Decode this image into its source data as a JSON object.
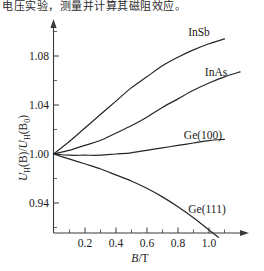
{
  "page": {
    "top_text_line": "电压实验，测量并计算其磁阻效应。"
  },
  "chart_data": {
    "type": "line",
    "title": "",
    "xlabel": "B/T",
    "ylabel": "U_H(B)/U_H(B_0)",
    "ylabel_parts": {
      "u1": "U",
      "sub1": "H",
      "mid": "(B)/",
      "u2": "U",
      "sub2": "H",
      "open": "(B",
      "sub3": "0",
      "close": ")"
    },
    "xlabel_parts": {
      "var": "B",
      "unit": "/T"
    },
    "xticks": [
      0.2,
      0.4,
      0.6,
      0.8,
      1.0
    ],
    "xtick_labels": [
      "0.2",
      "0.4",
      "0.6",
      "0.8",
      "1.0"
    ],
    "yticks": [
      0.94,
      1.0,
      1.04,
      1.08
    ],
    "ytick_labels": [
      "0.94",
      "1.00",
      "1.04",
      "1.08"
    ],
    "xlim": [
      0,
      1.22
    ],
    "ylim": [
      0.92,
      1.1
    ],
    "grid": false,
    "legend": "inline-curve-labels",
    "minor_ticks": true,
    "axis_arrows": true,
    "series": [
      {
        "name": "InSb",
        "label": "InSb",
        "color": "#262626",
        "x": [
          0.0,
          0.1,
          0.2,
          0.3,
          0.4,
          0.5,
          0.6,
          0.7,
          0.8,
          0.9,
          1.0,
          1.1
        ],
        "y": [
          1.0,
          1.01,
          1.021,
          1.032,
          1.043,
          1.054,
          1.063,
          1.072,
          1.079,
          1.085,
          1.09,
          1.094
        ]
      },
      {
        "name": "InAs",
        "label": "InAs",
        "color": "#262626",
        "x": [
          0.0,
          0.1,
          0.2,
          0.3,
          0.4,
          0.5,
          0.6,
          0.7,
          0.8,
          0.9,
          1.0,
          1.1,
          1.2
        ],
        "y": [
          1.0,
          1.003,
          1.007,
          1.011,
          1.017,
          1.023,
          1.03,
          1.038,
          1.045,
          1.052,
          1.058,
          1.063,
          1.067
        ]
      },
      {
        "name": "Ge(100)",
        "label": "Ge(100)",
        "color": "#262626",
        "x": [
          0.0,
          0.1,
          0.2,
          0.3,
          0.4,
          0.5,
          0.6,
          0.7,
          0.8,
          0.9,
          1.0,
          1.1
        ],
        "y": [
          1.0,
          0.999,
          0.999,
          0.999,
          1.0,
          1.001,
          1.003,
          1.005,
          1.007,
          1.009,
          1.011,
          1.012
        ]
      },
      {
        "name": "Ge(111)",
        "label": "Ge(111)",
        "color": "#262626",
        "x": [
          0.0,
          0.1,
          0.2,
          0.3,
          0.4,
          0.5,
          0.6,
          0.7,
          0.8,
          0.9,
          1.0,
          1.06
        ],
        "y": [
          1.0,
          0.996,
          0.992,
          0.988,
          0.983,
          0.978,
          0.972,
          0.965,
          0.957,
          0.948,
          0.938,
          0.932
        ]
      }
    ],
    "annotations": [
      {
        "text": "InSb",
        "x": 1.0,
        "y": 1.098
      },
      {
        "text": "InAs",
        "x": 1.08,
        "y": 1.072
      },
      {
        "text": "Ge(100)",
        "x": 0.98,
        "y": 1.02
      },
      {
        "text": "Ge(111)",
        "x": 1.02,
        "y": 0.94
      }
    ]
  }
}
